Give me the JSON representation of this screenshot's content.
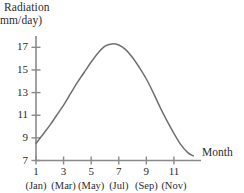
{
  "chart_data": {
    "type": "line",
    "title": "",
    "ylabel_line1": "Radiation",
    "ylabel_line2": "mm/day)",
    "xlabel": "Month",
    "xlim": [
      1,
      12.6
    ],
    "ylim": [
      7,
      18
    ],
    "grid": false,
    "legend": null,
    "y_ticks": [
      7,
      9,
      11,
      13,
      15,
      17
    ],
    "y_tick_labels": [
      "7",
      "9",
      "11",
      "13",
      "15",
      "17"
    ],
    "x_ticks": [
      1,
      3,
      5,
      7,
      9,
      11
    ],
    "x_tick_labels": [
      "1",
      "3",
      "5",
      "7",
      "9",
      "11"
    ],
    "x_tick_sublabels": [
      "(Jan)",
      "(Mar)",
      "(May)",
      "(Jul)",
      "(Sep)",
      "(Nov)"
    ],
    "series": [
      {
        "name": "Radiation",
        "color": "#6f6f6f",
        "x": [
          1,
          1.5,
          2,
          2.5,
          3,
          3.5,
          4,
          4.5,
          5,
          5.5,
          6,
          6.5,
          7,
          7.5,
          8,
          8.5,
          9,
          9.5,
          10,
          10.5,
          11,
          11.5,
          12,
          12.4
        ],
        "values": [
          8.5,
          9.3,
          10.1,
          11.0,
          11.9,
          12.9,
          13.9,
          14.8,
          15.7,
          16.5,
          17.1,
          17.3,
          17.2,
          16.8,
          16.1,
          15.2,
          14.2,
          13.0,
          11.7,
          10.5,
          9.4,
          8.4,
          7.7,
          7.4
        ]
      }
    ],
    "axis_color": "#8a8a8a",
    "text_color": "#2b2b2b",
    "peak": {
      "x": 6.3,
      "y": 17.3
    },
    "start": {
      "x": 1,
      "y": 8.5
    },
    "end": {
      "x": 12.4,
      "y": 7.4
    }
  }
}
